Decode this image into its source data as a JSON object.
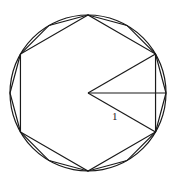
{
  "diagram": {
    "center": [
      88,
      93
    ],
    "radius_px": 78,
    "stroke_color": "#1a1a1a",
    "shapes": [
      {
        "type": "circle",
        "name": "circle"
      },
      {
        "type": "polygon",
        "name": "hexagon",
        "sides": 6,
        "start_angle_deg": 90
      },
      {
        "type": "polygon",
        "name": "dodecagon",
        "sides": 12,
        "start_angle_deg": 90
      }
    ],
    "radii_angles_deg": [
      30,
      0,
      -30
    ],
    "labels": [
      {
        "text": "1",
        "x": 112,
        "y": 111
      }
    ]
  }
}
